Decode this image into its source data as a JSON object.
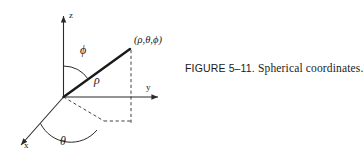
{
  "figure": {
    "caption_label": "FIGURE 5–11.",
    "caption_text": "Spherical coordinates.",
    "axes": {
      "z": "z",
      "y": "y",
      "x": "x"
    },
    "labels": {
      "rho": "ρ",
      "phi": "ϕ",
      "theta": "θ",
      "point": "(ρ,θ,ϕ)"
    },
    "colors": {
      "ink": "#1a1a1a",
      "line": "#2b2b2b",
      "background": "#ffffff"
    }
  }
}
